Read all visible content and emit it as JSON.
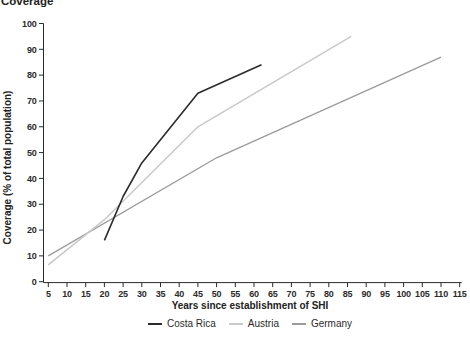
{
  "figure": {
    "title": "Coverage",
    "x_axis": {
      "label": "Years since establishment of SHI",
      "ticks": [
        5,
        10,
        15,
        20,
        25,
        30,
        35,
        40,
        45,
        50,
        55,
        60,
        65,
        70,
        75,
        80,
        85,
        90,
        95,
        100,
        105,
        110,
        115
      ]
    },
    "y_axis": {
      "label": "Coverage (% of total population)",
      "ticks": [
        0,
        10,
        20,
        30,
        40,
        50,
        60,
        70,
        80,
        90,
        100
      ]
    },
    "legend": [
      {
        "label": "Costa Rica",
        "color": "#2b2b2b"
      },
      {
        "label": "Austria",
        "color": "#c9c9c9"
      },
      {
        "label": "Germany",
        "color": "#9b9b9b"
      }
    ]
  },
  "chart_data": {
    "type": "line",
    "title": "Coverage",
    "xlabel": "Years since establishment of SHI",
    "ylabel": "Coverage (% of total population)",
    "xlim": [
      5,
      115
    ],
    "ylim": [
      0,
      100
    ],
    "x_ticks": [
      5,
      10,
      15,
      20,
      25,
      30,
      35,
      40,
      45,
      50,
      55,
      60,
      65,
      70,
      75,
      80,
      85,
      90,
      95,
      100,
      105,
      110,
      115
    ],
    "y_ticks": [
      0,
      10,
      20,
      30,
      40,
      50,
      60,
      70,
      80,
      90,
      100
    ],
    "grid": false,
    "legend_position": "bottom-center",
    "series": [
      {
        "name": "Costa Rica",
        "color": "#2b2b2b",
        "stroke_width": 1.6,
        "points": [
          [
            20,
            16
          ],
          [
            25,
            33
          ],
          [
            30,
            46
          ],
          [
            45,
            73
          ],
          [
            62,
            84
          ]
        ]
      },
      {
        "name": "Austria",
        "color": "#c9c9c9",
        "stroke_width": 1.5,
        "points": [
          [
            5,
            6.5
          ],
          [
            20,
            24
          ],
          [
            45,
            60
          ],
          [
            86,
            95
          ]
        ]
      },
      {
        "name": "Germany",
        "color": "#9b9b9b",
        "stroke_width": 1.3,
        "points": [
          [
            5,
            10
          ],
          [
            50,
            48
          ],
          [
            110,
            87
          ]
        ]
      }
    ]
  }
}
